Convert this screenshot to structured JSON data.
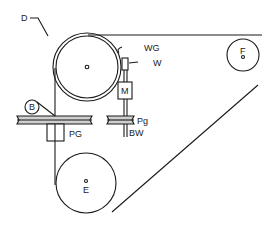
{
  "diagram": {
    "type": "belt-and-pulley mechanism",
    "line_color": "#1a1a1a",
    "fill_color": "#ffffff",
    "labels": {
      "D": "D",
      "WG": "WG",
      "W": "W",
      "M": "M",
      "F": "F",
      "B": "B",
      "PG": "PG",
      "Pg": "Pg",
      "BW": "BW",
      "E": "E"
    },
    "components": [
      {
        "id": "D",
        "desc": "large drum (upper left)"
      },
      {
        "id": "WG",
        "desc": "groove/rim on drum"
      },
      {
        "id": "W",
        "desc": "small wheel contacting drum"
      },
      {
        "id": "M",
        "desc": "motor block on shaft"
      },
      {
        "id": "F",
        "desc": "small pulley (upper right)"
      },
      {
        "id": "B",
        "desc": "small roller on left platter"
      },
      {
        "id": "PG",
        "desc": "left platter with hub"
      },
      {
        "id": "Pg",
        "desc": "right small platter"
      },
      {
        "id": "BW",
        "desc": "shaft below Pg"
      },
      {
        "id": "E",
        "desc": "large lower pulley"
      }
    ]
  }
}
